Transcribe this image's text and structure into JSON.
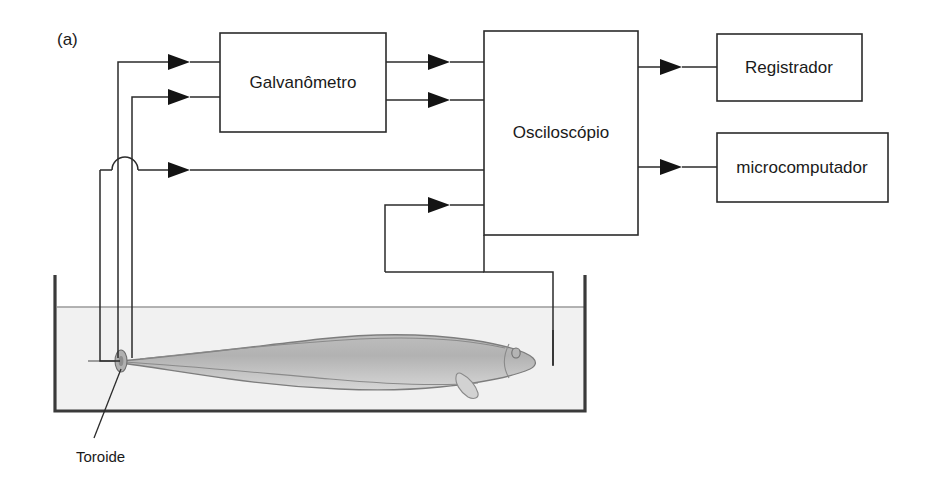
{
  "figure": {
    "panel_letter": "(a)",
    "background_color": "#ffffff",
    "line_color": "#2b2b2b"
  },
  "boxes": [
    {
      "id": "galvanometro",
      "label": "Galvanômetro",
      "x": 220,
      "y": 33,
      "w": 166,
      "h": 99
    },
    {
      "id": "osciloscopio",
      "label": "Osciloscópio",
      "x": 484,
      "y": 31,
      "w": 154,
      "h": 204
    },
    {
      "id": "registrador",
      "label": "Registrador",
      "x": 717,
      "y": 34,
      "w": 145,
      "h": 67
    },
    {
      "id": "microcomputador",
      "label": "microcomputador",
      "x": 717,
      "y": 133,
      "w": 171,
      "h": 69
    }
  ],
  "labels": {
    "toroide": "Toroide"
  },
  "tank": {
    "left": 55,
    "right": 585,
    "top": 275,
    "bottom": 411,
    "waterline": 307,
    "water_color": "#f1f1f1",
    "wall_color": "#3a3a3a"
  },
  "fish": {
    "name": "electric-fish",
    "body_color": "#c0c0c0",
    "outline_color": "#7d7d7d",
    "snout_x": 533,
    "tail_x": 120,
    "center_y": 362
  },
  "toroid": {
    "name": "toroide",
    "x": 121,
    "y": 360,
    "color": "#b0b0b0"
  },
  "signal_paths": [
    {
      "id": "toroid-to-galvanometer-top",
      "from": "toroide",
      "to": "galvanometro"
    },
    {
      "id": "toroid-to-galvanometer-bottom",
      "from": "toroide",
      "to": "galvanometro"
    },
    {
      "id": "toroid-to-oscilloscope",
      "from": "toroide",
      "to": "osciloscopio"
    },
    {
      "id": "galvanometer-to-oscilloscope-top",
      "from": "galvanometro",
      "to": "osciloscopio"
    },
    {
      "id": "galvanometer-to-oscilloscope-bottom",
      "from": "galvanometro",
      "to": "osciloscopio"
    },
    {
      "id": "oscilloscope-to-registrador",
      "from": "osciloscopio",
      "to": "registrador"
    },
    {
      "id": "oscilloscope-to-microcomputador",
      "from": "osciloscopio",
      "to": "microcomputador"
    },
    {
      "id": "tank-electrode-to-oscilloscope",
      "from": "tank-electrode",
      "to": "osciloscopio"
    }
  ]
}
